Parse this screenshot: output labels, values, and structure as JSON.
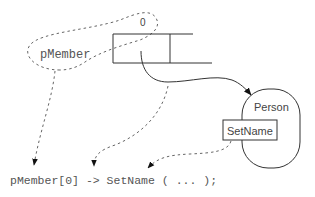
{
  "diagram": {
    "pointer_variable_label": "pMember",
    "array_index_label": "0",
    "object_label": "Person",
    "method_label": "SetName",
    "code_expression": "pMember[0] -> SetName ( ... );",
    "colors": {
      "stroke": "#333333",
      "dashed": "#666666",
      "text": "#555555"
    }
  }
}
